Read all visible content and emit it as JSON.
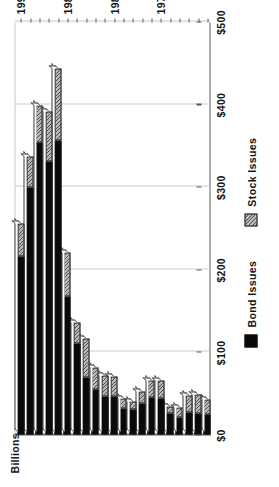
{
  "chart_data": {
    "type": "bar",
    "orientation": "horizontal-rotated",
    "stacked": true,
    "title": "",
    "xlabel": "",
    "ylabel": "Billions",
    "value_axis_label": "Billions",
    "value_ticks": [
      "$0",
      "$100",
      "$200",
      "$300",
      "$400",
      "$500"
    ],
    "value_tick_values": [
      0,
      100,
      200,
      300,
      400,
      500
    ],
    "xlim": [
      0,
      500
    ],
    "grid": true,
    "legend_position": "bottom",
    "categories": [
      "1970",
      "1971",
      "1972",
      "1973",
      "1974",
      "1975",
      "1976",
      "1977",
      "1978",
      "1979",
      "1980",
      "1981",
      "1982",
      "1983",
      "1984",
      "1985",
      "1986",
      "1987",
      "1988",
      "1989",
      "1990"
    ],
    "category_tick_labels": [
      "1975",
      "1980",
      "1985",
      "1990"
    ],
    "series": [
      {
        "name": "Bond Issues",
        "color": "#0a0a0a",
        "values": [
          24,
          26,
          27,
          21,
          26,
          44,
          45,
          38,
          30,
          31,
          46,
          46,
          54,
          69,
          110,
          167,
          356,
          331,
          354,
          299,
          215
        ]
      },
      {
        "name": "Stock Issues",
        "color": "#b9b9b9",
        "values": [
          18,
          22,
          20,
          12,
          8,
          21,
          20,
          14,
          10,
          12,
          24,
          25,
          27,
          47,
          26,
          53,
          87,
          60,
          44,
          38,
          40
        ]
      }
    ]
  },
  "legend": {
    "items": [
      {
        "label": "Bond Issues",
        "swatch": "solid-black"
      },
      {
        "label": "Stock Issues",
        "swatch": "gray-hatched"
      }
    ]
  },
  "axes": {
    "value_axis_title": "Billions"
  }
}
